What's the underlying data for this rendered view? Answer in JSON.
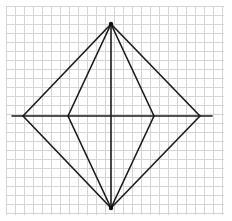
{
  "diagram": {
    "type": "geometric-figure-on-grid",
    "colors": {
      "background": "#ffffff",
      "grid": "#d4d4d4",
      "lines": "#1a1a1a"
    },
    "grid": {
      "x_start": 6,
      "y_start": 6,
      "x_end": 224,
      "y_end": 215,
      "spacing": 9
    },
    "points": {
      "top": [
        111,
        24
      ],
      "bottom": [
        111,
        208
      ],
      "outer_left": [
        23,
        116
      ],
      "outer_right": [
        200,
        116
      ],
      "inner_left": [
        68,
        116
      ],
      "inner_right": [
        154,
        116
      ]
    },
    "horizontal_axis": {
      "x1": 12,
      "x2": 212,
      "y": 116
    },
    "segments": [
      {
        "name": "outer-top-left",
        "from": "top",
        "to": "outer_left"
      },
      {
        "name": "outer-top-right",
        "from": "top",
        "to": "outer_right"
      },
      {
        "name": "outer-bottom-left",
        "from": "bottom",
        "to": "outer_left"
      },
      {
        "name": "outer-bottom-right",
        "from": "bottom",
        "to": "outer_right"
      },
      {
        "name": "inner-top-left",
        "from": "top",
        "to": "inner_left"
      },
      {
        "name": "inner-top-right",
        "from": "top",
        "to": "inner_right"
      },
      {
        "name": "inner-bottom-left",
        "from": "bottom",
        "to": "inner_left"
      },
      {
        "name": "inner-bottom-right",
        "from": "bottom",
        "to": "inner_right"
      },
      {
        "name": "vertical-diagonal",
        "from": "top",
        "to": "bottom"
      }
    ],
    "vertex_markers": [
      "top",
      "bottom"
    ]
  }
}
